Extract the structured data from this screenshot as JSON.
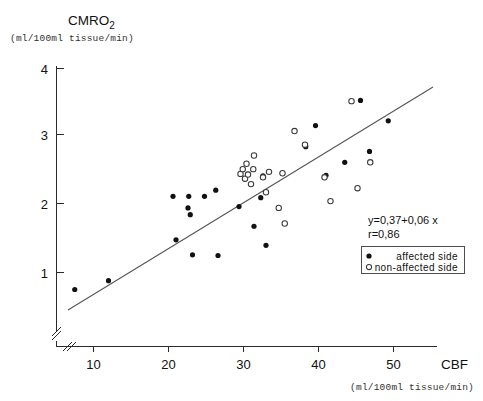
{
  "chart_data": {
    "type": "scatter",
    "title": "",
    "xlabel": "CBF",
    "xunits": "(ml/100ml tissue/min)",
    "ylabel": "CMRO",
    "ylabel_sub": "2",
    "yunits": "(ml/100ml tissue/min)",
    "xlim": [
      5,
      58
    ],
    "ylim": [
      0.45,
      4.0
    ],
    "xticks": [
      10,
      20,
      30,
      40,
      50
    ],
    "yticks": [
      1,
      2,
      3,
      4
    ],
    "grid": false,
    "axis_break": true,
    "legend_position": "lower-right",
    "annotations": {
      "equation": "y=0,37+0,06 x",
      "correlation": "r=0,86"
    },
    "fit_line": {
      "label": "regression-line",
      "x_start": 7.4,
      "y_start": 0.82,
      "x_end": 57.0,
      "y_end": 3.62
    },
    "series": [
      {
        "name": "affected side",
        "marker": "filled-circle",
        "color": "#111111",
        "points": [
          [
            7.5,
            0.75
          ],
          [
            12.0,
            0.88
          ],
          [
            20.6,
            2.12
          ],
          [
            21.0,
            1.48
          ],
          [
            22.6,
            1.95
          ],
          [
            22.7,
            2.12
          ],
          [
            22.9,
            1.85
          ],
          [
            23.2,
            1.26
          ],
          [
            24.8,
            2.12
          ],
          [
            26.3,
            2.21
          ],
          [
            26.6,
            1.25
          ],
          [
            29.4,
            1.97
          ],
          [
            31.4,
            1.68
          ],
          [
            32.3,
            2.1
          ],
          [
            32.6,
            2.42
          ],
          [
            33.0,
            1.4
          ],
          [
            38.3,
            2.85
          ],
          [
            39.6,
            3.16
          ],
          [
            41.0,
            2.43
          ],
          [
            43.5,
            2.62
          ],
          [
            45.6,
            3.53
          ],
          [
            46.8,
            2.78
          ],
          [
            49.3,
            3.23
          ]
        ]
      },
      {
        "name": "non-affected side",
        "marker": "open-circle",
        "color": "#ffffff",
        "points": [
          [
            29.6,
            2.45
          ],
          [
            29.9,
            2.52
          ],
          [
            30.2,
            2.38
          ],
          [
            30.4,
            2.6
          ],
          [
            30.6,
            2.44
          ],
          [
            31.0,
            2.3
          ],
          [
            31.3,
            2.52
          ],
          [
            31.4,
            2.72
          ],
          [
            32.6,
            2.4
          ],
          [
            33.0,
            2.18
          ],
          [
            33.4,
            2.48
          ],
          [
            34.7,
            1.95
          ],
          [
            35.2,
            2.46
          ],
          [
            35.5,
            1.72
          ],
          [
            36.8,
            3.08
          ],
          [
            38.2,
            2.88
          ],
          [
            40.8,
            2.4
          ],
          [
            41.6,
            2.05
          ],
          [
            44.4,
            3.52
          ],
          [
            45.2,
            2.24
          ],
          [
            46.9,
            2.62
          ]
        ]
      }
    ]
  }
}
